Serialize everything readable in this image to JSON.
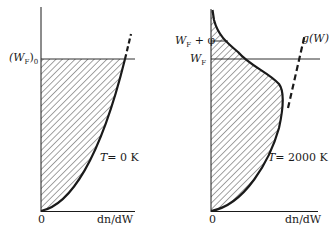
{
  "panels": [
    {
      "id": "left",
      "y_label": "(W_F)_0",
      "y_label_main": "(W",
      "y_label_sub": "F",
      "y_label_tail": ")",
      "y_label_sub2": "0",
      "origin": "0",
      "x_label": "dn/dW",
      "temperature": "T = 0 K",
      "temperature_var": "T",
      "temperature_val": "= 0 K"
    },
    {
      "id": "right",
      "y_label_1": "W_F + φ",
      "y_label_1_main": "W",
      "y_label_1_sub": "F",
      "y_label_1_tail": " + φ",
      "y_label_2": "W_F",
      "y_label_2_main": "W",
      "y_label_2_sub": "F",
      "origin": "0",
      "x_label": "dn/dW",
      "curve_label": "g(W)",
      "temperature": "T = 2000 K",
      "temperature_var": "T",
      "temperature_val": "= 2000 K"
    }
  ],
  "colors": {
    "ink": "#1a1a1a",
    "hatch": "#333333",
    "background": "#ffffff"
  }
}
